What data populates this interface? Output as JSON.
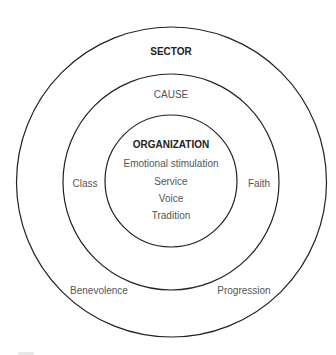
{
  "diagram": {
    "type": "concentric-circles",
    "rings": [
      {
        "id": "sector",
        "title": "SECTOR",
        "labels": [
          "Benevolence",
          "Progression"
        ]
      },
      {
        "id": "cause",
        "title": "CAUSE",
        "labels": [
          "Class",
          "Faith"
        ]
      },
      {
        "id": "organization",
        "title": "ORGANIZATION",
        "labels": [
          "Emotional stimulation",
          "Service",
          "Voice",
          "Tradition"
        ]
      }
    ],
    "colors": {
      "stroke": "#222222",
      "title_text": "#222222",
      "label_text": "#555555",
      "background": "#ffffff"
    }
  }
}
